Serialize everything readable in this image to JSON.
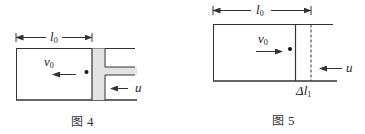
{
  "figures": [
    {
      "id": "fig4",
      "caption_prefix": "图",
      "caption_number": "4",
      "length_label": "l",
      "length_sub": "0",
      "velocity_label": "v",
      "velocity_sub": "0",
      "piston_velocity_label": "u",
      "velocity_direction": "left",
      "piston_velocity_direction": "left"
    },
    {
      "id": "fig5",
      "caption_prefix": "图",
      "caption_number": "5",
      "length_label": "l",
      "length_sub": "0",
      "velocity_label": "v",
      "velocity_sub": "0",
      "piston_velocity_label": "u",
      "displacement_label": "Δl",
      "displacement_sub": "1",
      "velocity_direction": "right",
      "piston_velocity_direction": "left"
    }
  ],
  "colors": {
    "line": "#333333",
    "piston_fill": "#e3e3e3"
  }
}
